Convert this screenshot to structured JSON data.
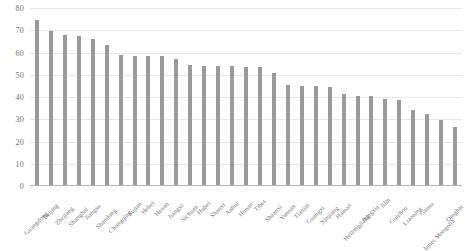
{
  "chart_data": {
    "type": "bar",
    "title": "",
    "subtitle": "",
    "xlabel": "",
    "ylabel": "",
    "ylim": [
      0,
      80
    ],
    "y_ticks": [
      0,
      10,
      20,
      30,
      40,
      50,
      60,
      70,
      80
    ],
    "grid": true,
    "legend": "none",
    "bar_color": "#9a9a9a",
    "grid_color": "#e8e8e8",
    "axis_color": "#b4b4b4",
    "label_color": "#6f6f6f",
    "categories": [
      "Guangdong",
      "Beijing",
      "Zhejiang",
      "Shanghai",
      "Jiangsu",
      "Shandong",
      "Chongqing",
      "Fujian",
      "Hebei",
      "Henan",
      "Jiangxi",
      "Sichuan",
      "Hubei",
      "Shanxi",
      "Anhui",
      "Hunan",
      "Tibet",
      "Shaanxi",
      "Yunnan",
      "Tianjin",
      "Guangxi",
      "Xinjiang",
      "Hainan",
      "Heilongjiang",
      "Ningxia",
      "Jilin",
      "Guizhou",
      "Liaoning",
      "Gansu",
      "Inner Mongolia",
      "Qinghai"
    ],
    "values": [
      74.5,
      69.5,
      68.0,
      67.5,
      66.0,
      63.5,
      59.0,
      58.5,
      58.5,
      58.5,
      57.0,
      54.5,
      54.0,
      54.0,
      54.0,
      53.5,
      53.5,
      51.0,
      45.5,
      45.0,
      45.0,
      44.5,
      41.5,
      40.5,
      40.5,
      39.0,
      38.5,
      34.0,
      32.5,
      29.5,
      26.5
    ]
  }
}
